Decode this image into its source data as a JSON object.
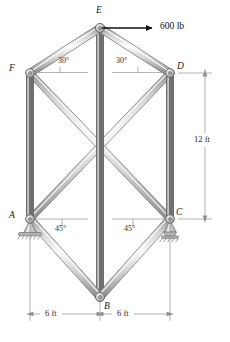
{
  "figure": {
    "joints": [
      {
        "id": "A",
        "label": "A",
        "x": 30,
        "y": 219,
        "support": "pin"
      },
      {
        "id": "B",
        "label": "B",
        "x": 100,
        "y": 297,
        "support": "none"
      },
      {
        "id": "C",
        "label": "C",
        "x": 170,
        "y": 219,
        "support": "rocker"
      },
      {
        "id": "D",
        "label": "D",
        "x": 170,
        "y": 73,
        "support": "none"
      },
      {
        "id": "E",
        "label": "E",
        "x": 100,
        "y": 28,
        "support": "none"
      },
      {
        "id": "F",
        "label": "F",
        "x": 30,
        "y": 73,
        "support": "none"
      }
    ],
    "members": [
      {
        "from": "F",
        "to": "E"
      },
      {
        "from": "E",
        "to": "D"
      },
      {
        "from": "F",
        "to": "A"
      },
      {
        "from": "D",
        "to": "C"
      },
      {
        "from": "A",
        "to": "B"
      },
      {
        "from": "B",
        "to": "C"
      },
      {
        "from": "E",
        "to": "B"
      },
      {
        "from": "F",
        "to": "C"
      },
      {
        "from": "A",
        "to": "D"
      }
    ],
    "load": {
      "label": "600 lb",
      "at_joint": "E",
      "direction": "right",
      "arrow_from_x": 102,
      "arrow_from_y": 28,
      "arrow_to_x": 155,
      "arrow_to_y": 28,
      "label_x": 160,
      "label_y": 23
    },
    "angles": [
      {
        "value": "30°",
        "at_joint": "F",
        "x": 58,
        "y": 60
      },
      {
        "value": "30°",
        "at_joint": "D",
        "x": 118,
        "y": 60
      },
      {
        "value": "45°",
        "at_joint": "A",
        "x": 57,
        "y": 226
      },
      {
        "value": "45°",
        "at_joint": "C",
        "x": 126,
        "y": 226
      }
    ],
    "dimensions": [
      {
        "id": "height",
        "label": "12 ft",
        "orientation": "vertical",
        "label_x": 196,
        "label_y": 140
      },
      {
        "id": "span-left",
        "label": "6 ft",
        "orientation": "horizontal",
        "label_x": 48,
        "label_y": 318
      },
      {
        "id": "span-right",
        "label": "6 ft",
        "orientation": "horizontal",
        "label_x": 120,
        "label_y": 318
      }
    ],
    "colors": {
      "member_fill_light": "#f2f2f2",
      "member_fill_mid": "#c9c9c9",
      "member_fill_dark": "#8e8e8e",
      "member_outline": "#6f6f6f",
      "joint_fill": "#bdbdbd",
      "dimension_line": "#9a9a9a",
      "arrow": "#111111",
      "text": "#1a1a1a",
      "background": "#ffffff"
    }
  }
}
